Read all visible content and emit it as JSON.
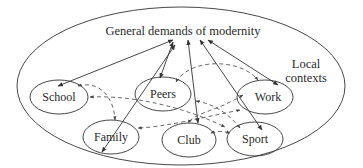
{
  "diagram": {
    "title": "General demands of modernity",
    "region_label_line1": "Local",
    "region_label_line2": "contexts",
    "nodes": [
      {
        "id": "school",
        "label": "School"
      },
      {
        "id": "peers",
        "label": "Peers"
      },
      {
        "id": "work",
        "label": "Work"
      },
      {
        "id": "family",
        "label": "Family"
      },
      {
        "id": "club",
        "label": "Club"
      },
      {
        "id": "sport",
        "label": "Sport"
      }
    ],
    "solid_links": [
      {
        "from": "general-demands",
        "to": "school",
        "arrows": "both"
      },
      {
        "from": "general-demands",
        "to": "peers",
        "arrows": "both"
      },
      {
        "from": "general-demands",
        "to": "family",
        "arrows": "both"
      },
      {
        "from": "general-demands",
        "to": "club",
        "arrows": "both"
      },
      {
        "from": "general-demands",
        "to": "work",
        "arrows": "both"
      },
      {
        "from": "general-demands",
        "to": "sport",
        "arrows": "both"
      }
    ],
    "dashed_links": [
      {
        "from": "peers",
        "to": "work",
        "arrows": "both"
      },
      {
        "from": "school",
        "to": "family",
        "arrows": "both"
      },
      {
        "from": "peers",
        "to": "school",
        "arrows": "both"
      },
      {
        "from": "work",
        "to": "family",
        "arrows": "both"
      },
      {
        "from": "club",
        "to": "sport",
        "arrows": "both"
      },
      {
        "from": "school",
        "to": "club",
        "arrows": "both"
      },
      {
        "from": "club",
        "to": "work",
        "arrows": "both"
      }
    ],
    "colors": {
      "stroke": "#333333",
      "text": "#2a2a2a",
      "background": "#ffffff"
    }
  }
}
